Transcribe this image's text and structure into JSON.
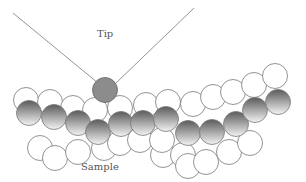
{
  "diagram": {
    "labels": {
      "tip": "Tip",
      "sample": "Sample"
    },
    "colors": {
      "outline": "#777777",
      "atom_dark": "#5e5e5e",
      "atom_light": "#f2f2f2",
      "tip_atom": "#8c8c8c",
      "background": "#ffffff"
    },
    "surface_atom_count": 12,
    "upper_open_atom_count": 11,
    "lower_open_atom_count": 12
  }
}
